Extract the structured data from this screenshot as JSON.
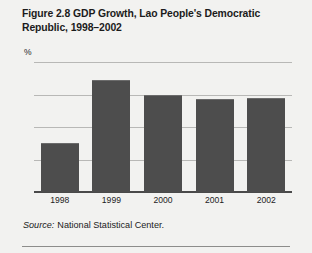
{
  "figure": {
    "number": "Figure 2.8",
    "title": "GDP Growth, Lao People's Democratic Republic, 1998–2002",
    "axis_unit": "%",
    "source_word": "Source:",
    "source_text": "National Statistical Center.",
    "bar_color": "#4d4d4d",
    "panel_color": "#f2f2f0",
    "gridline_color": "#b8b8b6"
  },
  "chart_data": {
    "type": "bar",
    "categories": [
      "1998",
      "1999",
      "2000",
      "2001",
      "2002"
    ],
    "values": [
      3.0,
      6.9,
      6.0,
      5.7,
      5.8
    ],
    "xlabel": "",
    "ylabel": "%",
    "ylim": [
      0,
      8
    ],
    "yticks": [
      0,
      2,
      4,
      6,
      8
    ],
    "ytick_labels": [
      "0",
      "2",
      "4",
      "6",
      "8"
    ],
    "grid": true,
    "legend": "none",
    "series": [
      {
        "name": "GDP growth",
        "values": [
          3.0,
          6.9,
          6.0,
          5.7,
          5.8
        ]
      }
    ]
  }
}
